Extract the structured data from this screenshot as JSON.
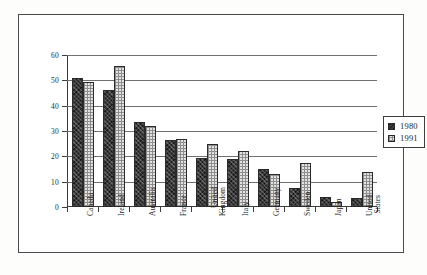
{
  "chart_data": {
    "type": "bar",
    "title": "",
    "xlabel": "",
    "ylabel": "",
    "ylim": [
      0,
      60
    ],
    "yticks": [
      0,
      10,
      20,
      30,
      40,
      50,
      60
    ],
    "grid": true,
    "legend_position": "right",
    "categories": [
      "Canada",
      "Ireland",
      "Australia",
      "France",
      "United Kingdom",
      "Italy",
      "Germany",
      "Sweden",
      "Japan",
      "United States"
    ],
    "category_lines": [
      [
        "Canada"
      ],
      [
        "Ireland"
      ],
      [
        "Australia"
      ],
      [
        "France"
      ],
      [
        "United",
        "Kingdom"
      ],
      [
        "Italy"
      ],
      [
        "Germany"
      ],
      [
        "Sweden"
      ],
      [
        "Japan"
      ],
      [
        "United",
        "States"
      ]
    ],
    "series": [
      {
        "name": "1980",
        "color": "#3a3a3a",
        "pattern": "dark-crosshatch",
        "values": [
          51,
          46,
          33.5,
          26.5,
          19.5,
          19,
          15,
          7.5,
          4,
          3.5
        ]
      },
      {
        "name": "1991",
        "color": "#e2e2e2",
        "pattern": "light-check",
        "values": [
          49.5,
          55.5,
          32,
          26.8,
          25,
          22,
          13,
          17.5,
          2,
          14
        ]
      }
    ]
  },
  "legend": {
    "items": [
      {
        "label": "1980",
        "swatch": "dark-crosshatch-swatch"
      },
      {
        "label": "1991",
        "swatch": "light-check-swatch"
      }
    ]
  }
}
